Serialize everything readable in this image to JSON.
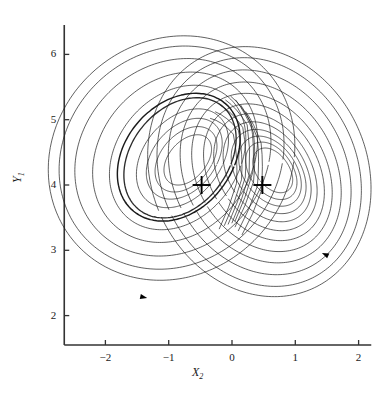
{
  "chart_data": {
    "type": "line",
    "title": "",
    "subtitle": "",
    "xlabel": "X2",
    "xlabel_base": "X",
    "xlabel_sub": "2",
    "ylabel": "Y1",
    "ylabel_base": "Y",
    "ylabel_sub": "1",
    "grid": false,
    "legend": "none",
    "xlim": [
      -2.65,
      2.2
    ],
    "ylim": [
      1.55,
      6.45
    ],
    "xticks": [
      -2,
      -1,
      0,
      1,
      2
    ],
    "xtick_labels": [
      "−2",
      "−1",
      "0",
      "1",
      "2"
    ],
    "yticks": [
      2,
      3,
      4,
      5,
      6
    ],
    "ytick_labels": [
      "2",
      "3",
      "4",
      "5",
      "6"
    ],
    "axis_color": "#333333",
    "curve_color": "#1a1a1a",
    "marker_color": "#000000",
    "background": "#ffffff",
    "series": [
      {
        "name": "trajectory",
        "kind": "chaotic-attractor-orbit",
        "linewidth": 0.75
      }
    ],
    "markers": [
      {
        "name": "fixed-point-left",
        "symbol": "plus",
        "x": -0.48,
        "y": 4.0,
        "size": 9
      },
      {
        "name": "fixed-point-right",
        "symbol": "plus",
        "x": 0.48,
        "y": 4.0,
        "size": 9
      }
    ],
    "annotations": [
      {
        "name": "direction-arrow-lower-left",
        "symbol": "arrowhead",
        "x": -1.34,
        "y": 2.27,
        "angle": 12
      },
      {
        "name": "direction-arrow-right",
        "symbol": "arrowhead",
        "x": 1.42,
        "y": 2.96,
        "angle": 205
      }
    ],
    "attractor": {
      "lobe_left_center_x": -0.62,
      "lobe_left_center_y": 4.35,
      "lobe_right_center_x": 0.72,
      "lobe_right_center_y": 4.25,
      "outer_extent_x": [
        -2.42,
        1.95
      ],
      "outer_extent_y": [
        1.95,
        6.33
      ],
      "turns_left": 7,
      "turns_right": 9
    }
  }
}
